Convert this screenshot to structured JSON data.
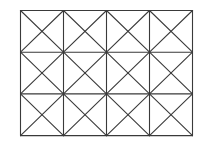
{
  "diagram": {
    "type": "grid-with-diagonals",
    "columns": 4,
    "rows": 3,
    "origin": [
      20.5,
      10.5
    ],
    "cell_width": 43,
    "cell_height": 41.7,
    "diagonals": "both",
    "stroke_color": "#3a3a3a",
    "stroke_width": 1.1,
    "background": "#ffffff"
  }
}
